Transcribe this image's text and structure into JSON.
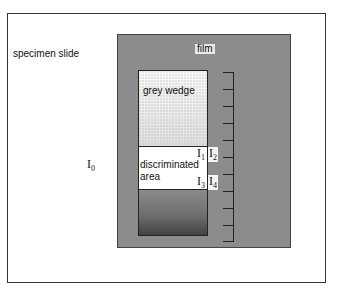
{
  "diagram": {
    "labels": {
      "specimen_slide": "specimen slide",
      "film": "film",
      "grey_wedge": "grey wedge",
      "discriminated_area_line1": "discriminated",
      "discriminated_area_line2": "area",
      "I0": {
        "base": "I",
        "sub": "0"
      },
      "I1": {
        "base": "I",
        "sub": "1"
      },
      "I2": {
        "base": "I",
        "sub": "2"
      },
      "I3": {
        "base": "I",
        "sub": "3"
      },
      "I4": {
        "base": "I",
        "sub": "4"
      }
    },
    "scale": {
      "tick_count": 11
    },
    "colors": {
      "film_fill": "#c9c9c9",
      "frame_stroke": "#333333",
      "wedge_dark": "#111111",
      "wedge_light": "#fafafa"
    }
  }
}
